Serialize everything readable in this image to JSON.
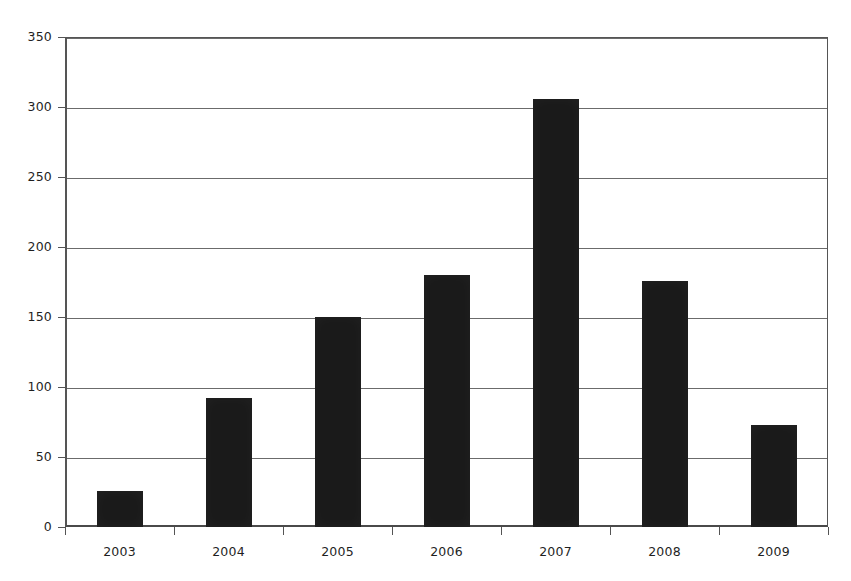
{
  "chart_data": {
    "type": "bar",
    "title": "",
    "subtitle": "",
    "xlabel": "",
    "ylabel": "",
    "categories": [
      "2003",
      "2004",
      "2005",
      "2006",
      "2007",
      "2008",
      "2009"
    ],
    "values": [
      26,
      92,
      150,
      180,
      306,
      176,
      73
    ],
    "series": [
      {
        "name": "",
        "values": [
          26,
          92,
          150,
          180,
          306,
          176,
          73
        ]
      }
    ],
    "ylim": [
      0,
      350
    ],
    "yticks": [
      0,
      50,
      100,
      150,
      200,
      250,
      300,
      350
    ],
    "ytick_labels": [
      "0",
      "50",
      "100",
      "150",
      "200",
      "250",
      "300",
      "350"
    ],
    "grid": true,
    "grid_axis": "y",
    "legend": false,
    "legend_position": "none",
    "bar_color": "#1a1a1a",
    "gridline_color": "#6b6b6b",
    "axis_color": "#555555",
    "background_color": "#ffffff",
    "annotations": []
  }
}
